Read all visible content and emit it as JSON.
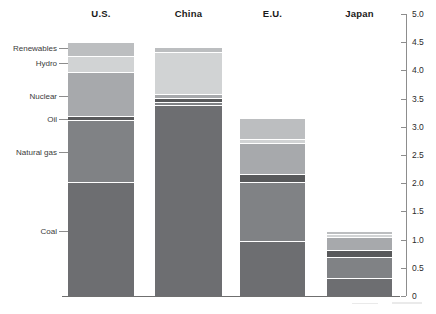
{
  "chart_data": {
    "type": "bar",
    "subtype": "stacked",
    "title": "",
    "xlabel": "",
    "ylabel": "",
    "categories": [
      "U.S.",
      "China",
      "E.U.",
      "Japan"
    ],
    "series": [
      {
        "name": "Coal",
        "color": "#6d6e71",
        "values": [
          2.0,
          3.37,
          0.95,
          0.3
        ]
      },
      {
        "name": "Natural gas",
        "color": "#808285",
        "values": [
          1.1,
          0.06,
          1.05,
          0.38
        ]
      },
      {
        "name": "Oil",
        "color": "#58595b",
        "values": [
          0.07,
          0.07,
          0.14,
          0.12
        ]
      },
      {
        "name": "Nuclear",
        "color": "#a7a9ac",
        "values": [
          0.79,
          0.07,
          0.56,
          0.22
        ]
      },
      {
        "name": "Hydro",
        "color": "#d1d3d4",
        "values": [
          0.28,
          0.73,
          0.07,
          0.07
        ]
      },
      {
        "name": "Renewables",
        "color": "#bcbec0",
        "values": [
          0.24,
          0.1,
          0.37,
          0.05
        ]
      }
    ],
    "stack_order_bottom_to_top": [
      "Coal",
      "Natural gas",
      "Oil",
      "Nuclear",
      "Hydro",
      "Renewables"
    ],
    "totals": [
      4.48,
      4.4,
      3.14,
      1.14
    ],
    "ylim": [
      0,
      5.0
    ],
    "y_ticks": [
      "0",
      "0.5",
      "1.0",
      "1.5",
      "2.0",
      "2.5",
      "3.0",
      "3.5",
      "4.0",
      "4.5",
      "5.0"
    ],
    "y_tick_values": [
      0,
      0.5,
      1.0,
      1.5,
      2.0,
      2.5,
      3.0,
      3.5,
      4.0,
      4.5,
      5.0
    ],
    "axis_position": "right",
    "grid": false,
    "legend": "left-side category labels with leader lines",
    "category_labels": [
      "Renewables",
      "Hydro",
      "Nuclear",
      "Oil",
      "Natural gas",
      "Coal"
    ]
  },
  "axis": {
    "ticks": [
      {
        "label": "5.0",
        "value": 5.0
      },
      {
        "label": "4.5",
        "value": 4.5
      },
      {
        "label": "4.0",
        "value": 4.0
      },
      {
        "label": "3.5",
        "value": 3.5
      },
      {
        "label": "3.0",
        "value": 3.0
      },
      {
        "label": "2.5",
        "value": 2.5
      },
      {
        "label": "2.0",
        "value": 2.0
      },
      {
        "label": "1.5",
        "value": 1.5
      },
      {
        "label": "1.0",
        "value": 1.0
      },
      {
        "label": "0.5",
        "value": 0.5
      },
      {
        "label": "0",
        "value": 0.0
      }
    ]
  },
  "columns": [
    {
      "label": "U.S."
    },
    {
      "label": "China"
    },
    {
      "label": "E.U."
    },
    {
      "label": "Japan"
    }
  ],
  "side_labels": [
    {
      "label": "Renewables"
    },
    {
      "label": "Hydro"
    },
    {
      "label": "Nuclear"
    },
    {
      "label": "Oil"
    },
    {
      "label": "Natural gas"
    },
    {
      "label": "Coal"
    }
  ],
  "colors": {
    "coal": "#6d6e71",
    "natural_gas": "#808285",
    "oil": "#58595b",
    "nuclear": "#a7a9ac",
    "hydro": "#d1d3d4",
    "renewables": "#bcbec0",
    "axis": "#8d8d8d",
    "text": "#231f20",
    "background": "#ffffff"
  }
}
